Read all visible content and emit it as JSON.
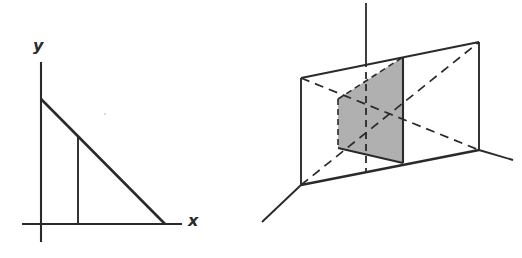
{
  "figure": {
    "background_color": "#ffffff",
    "stroke_color": "#2a2a2a",
    "shade_color": "#b0b0b0",
    "panels": [
      {
        "name": "left-panel",
        "caption": "Right triangle in the xy-plane with an interior vertical segment",
        "labels": {
          "y_axis": "y",
          "x_axis": "x"
        }
      },
      {
        "name": "right-panel",
        "caption": "Perspective box with vertical axis, dashed diagonals and a shaded cross-section plane",
        "labels": {}
      }
    ]
  },
  "left_panel": {
    "y_label": "y",
    "x_label": "x",
    "geometry": {
      "y_axis": {
        "x": 41,
        "y_top": 62,
        "y_bottom": 242
      },
      "x_axis": {
        "y": 224,
        "x_left": 22,
        "x_right": 182
      },
      "triangle_apex": {
        "x": 41,
        "y": 99
      },
      "triangle_foot": {
        "x": 165,
        "y": 224
      },
      "inner_vertical": {
        "x": 78,
        "y_top": 136,
        "y_bottom": 224
      }
    }
  },
  "right_panel": {
    "geometry": {
      "vertical_axis": {
        "x": 366,
        "y_top": 3,
        "y_bottom": 172
      },
      "rect_back_top_left": {
        "x": 301,
        "y": 78
      },
      "rect_back_bottom_left": {
        "x": 301,
        "y": 185
      },
      "rect_front_top_right": {
        "x": 479,
        "y": 42
      },
      "rect_front_bottom_right": {
        "x": 479,
        "y": 150
      },
      "shaded_top_right": {
        "x": 403,
        "y": 57
      },
      "shaded_bottom_right": {
        "x": 403,
        "y": 163
      },
      "shaded_top_left": {
        "x": 338,
        "y": 99
      },
      "shaded_bottom_left": {
        "x": 338,
        "y": 148
      },
      "ray_lower_left_end": {
        "x": 262,
        "y": 222
      },
      "ray_right_end": {
        "x": 513,
        "y": 160
      }
    }
  }
}
